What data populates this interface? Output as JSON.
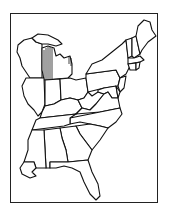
{
  "map": {
    "type": "outline-map",
    "region": "Eastern United States",
    "style": "black outline on white",
    "colors": {
      "outline": "#111111",
      "fill": "#ffffff",
      "frame": "#222222"
    },
    "highlighted": {
      "state": "Michigan (western Lower Peninsula)",
      "pattern": "vertical-hatch"
    },
    "states": [
      "Wisconsin",
      "Michigan",
      "Illinois",
      "Indiana",
      "Ohio",
      "Kentucky",
      "Tennessee",
      "Mississippi",
      "Alabama",
      "Georgia",
      "Florida",
      "South Carolina",
      "North Carolina",
      "Virginia",
      "West Virginia",
      "Pennsylvania",
      "New York",
      "Vermont",
      "New Hampshire",
      "Maine",
      "Massachusetts",
      "Connecticut",
      "Rhode Island",
      "New Jersey",
      "Delaware",
      "Maryland",
      "Louisiana"
    ]
  }
}
